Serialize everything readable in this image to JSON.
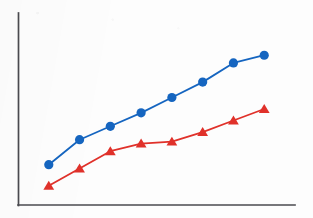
{
  "chart_data": {
    "type": "line",
    "title": "",
    "subtitle": "",
    "xlabel": "",
    "ylabel": "",
    "grid": false,
    "legend": "none",
    "axes_shown": [
      "left",
      "bottom"
    ],
    "tick_labels": {
      "x": [],
      "y": []
    },
    "xlim": [
      0,
      9
    ],
    "ylim": [
      0,
      10
    ],
    "x": [
      1,
      2,
      3,
      4,
      5,
      6,
      7,
      8
    ],
    "series": [
      {
        "name": "Series 1",
        "marker": "circle",
        "color": "#1565c0",
        "values": [
          2.1,
          3.4,
          4.1,
          4.8,
          5.6,
          6.4,
          7.4,
          7.8
        ]
      },
      {
        "name": "Series 2",
        "marker": "triangle",
        "color": "#e0312a",
        "values": [
          1.0,
          1.9,
          2.8,
          3.2,
          3.3,
          3.8,
          4.4,
          5.0
        ]
      }
    ],
    "annotations": []
  },
  "figure": {
    "caption": "",
    "background_color": "#fdfdfd",
    "axis_color": "#4a4a4f",
    "accent_blue": "#1565c0",
    "accent_red": "#e0312a"
  },
  "alt_text": "Line chart with two ascending series drawn on plain left and bottom axes with no tick labels: a blue line with round markers rising from lower left to upper right, and a red line with triangular markers following a similar but lower and flatter path."
}
